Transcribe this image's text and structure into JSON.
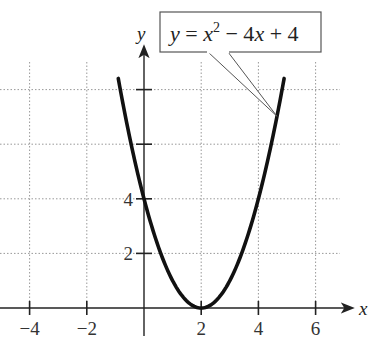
{
  "chart_data": {
    "type": "line",
    "title": "",
    "equation": "y = x^2 - 4x + 4",
    "equation_parts": {
      "lhs": "y = x",
      "exp": "2",
      "rhs": " − 4x + 4"
    },
    "xlabel": "x",
    "ylabel": "y",
    "xlim": [
      -5,
      7.5
    ],
    "ylim": [
      -1,
      10
    ],
    "grid": true,
    "grid_style": "dotted",
    "x_ticks": [
      -4,
      -2,
      2,
      4,
      6
    ],
    "x_tick_labels": [
      "−4",
      "−2",
      "2",
      "4",
      "6"
    ],
    "y_ticks": [
      2,
      4,
      6,
      8
    ],
    "y_tick_labels": [
      "2",
      "4",
      "",
      ""
    ],
    "vertex": {
      "x": 2,
      "y": 0
    },
    "y_intercept": {
      "x": 0,
      "y": 4
    },
    "series": [
      {
        "name": "y = x^2 - 4x + 4",
        "function": "x^2 - 4x + 4",
        "x_range": [
          -0.9,
          4.9
        ],
        "x": [
          -0.9,
          -0.5,
          0,
          0.5,
          1,
          1.5,
          2,
          2.5,
          3,
          3.5,
          4,
          4.5,
          4.9
        ],
        "y": [
          8.41,
          6.25,
          4,
          2.25,
          1,
          0.25,
          0,
          0.25,
          1,
          2.25,
          4,
          6.25,
          8.41
        ]
      }
    ],
    "annotation": {
      "text": "y = x^2 - 4x + 4",
      "style": "callout box pointing to curve near x=4.6"
    }
  }
}
